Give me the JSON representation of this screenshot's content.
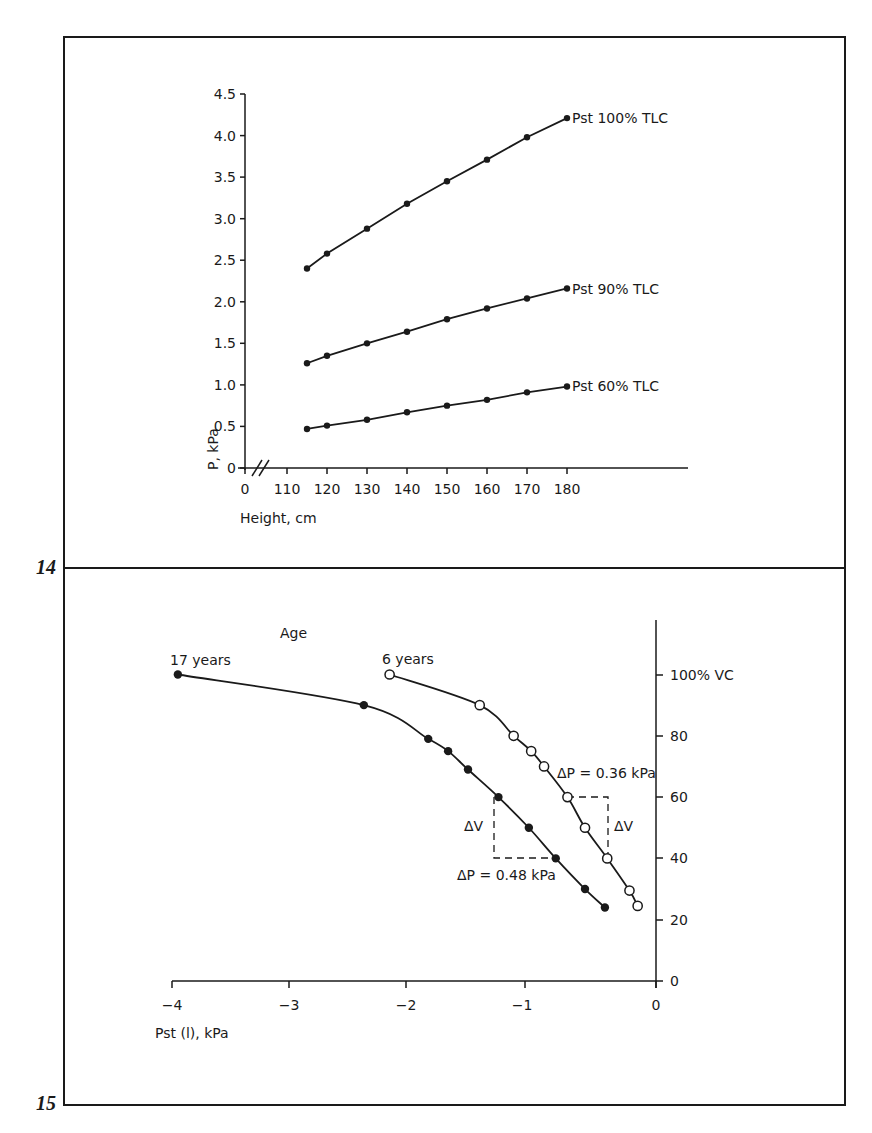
{
  "figures": [
    {
      "number": "14"
    },
    {
      "number": "15"
    }
  ],
  "chart_data": [
    {
      "type": "line",
      "figure": "14",
      "title": "",
      "xlabel": "Height, cm",
      "ylabel": "P, kPa",
      "x_ticks": [
        "0",
        "110",
        "120",
        "130",
        "140",
        "150",
        "160",
        "170",
        "180"
      ],
      "y_ticks": [
        "0",
        "0.5",
        "1.0",
        "1.5",
        "2.0",
        "2.5",
        "3.0",
        "3.5",
        "4.0",
        "4.5"
      ],
      "axis_break": "x axis broken between 0 and 110",
      "xlim": [
        110,
        180
      ],
      "ylim": [
        0,
        4.5
      ],
      "grid": false,
      "legend_position": "inline labels at right end of each line",
      "x": [
        115,
        120,
        130,
        140,
        150,
        160,
        170,
        180
      ],
      "series": [
        {
          "name": "Pst 100% TLC",
          "marker": "filled",
          "values": [
            2.4,
            2.58,
            2.88,
            3.18,
            3.45,
            3.71,
            3.98,
            4.21
          ]
        },
        {
          "name": "Pst 90% TLC",
          "marker": "filled",
          "values": [
            1.26,
            1.35,
            1.5,
            1.64,
            1.79,
            1.92,
            2.04,
            2.16
          ]
        },
        {
          "name": "Pst 60% TLC",
          "marker": "filled",
          "values": [
            0.47,
            0.51,
            0.58,
            0.67,
            0.75,
            0.82,
            0.91,
            0.98
          ]
        }
      ]
    },
    {
      "type": "line",
      "figure": "15",
      "title": "Age",
      "xlabel": "Pst (l), kPa",
      "ylabel": "% VC",
      "x_ticks": [
        "-4",
        "-3",
        "-2",
        "-1",
        "0"
      ],
      "y_ticks": [
        "0",
        "20",
        "40",
        "60",
        "80",
        "100% VC"
      ],
      "xlim": [
        -4,
        0
      ],
      "ylim": [
        0,
        115
      ],
      "y_axis_position": "right",
      "grid": false,
      "series": [
        {
          "name": "17 years",
          "marker": "filled",
          "x": [
            -3.95,
            -2.36,
            -1.81,
            -1.64,
            -1.47,
            -1.21,
            -0.95,
            -0.72,
            -0.47,
            -0.3
          ],
          "y": [
            100,
            90,
            79,
            75,
            69,
            60,
            50,
            40,
            30,
            24
          ]
        },
        {
          "name": "6 years",
          "marker": "open",
          "x": [
            -2.14,
            -1.37,
            -1.08,
            -0.93,
            -0.82,
            -0.62,
            -0.47,
            -0.28,
            -0.09,
            -0.02
          ],
          "y": [
            100,
            90,
            80,
            75,
            70,
            60,
            50,
            40,
            29.5,
            24.5
          ]
        }
      ],
      "annotations": [
        {
          "text": "ΔV",
          "series": "17 years"
        },
        {
          "text": "ΔP = 0.48 kPa",
          "series": "17 years"
        },
        {
          "text": "ΔV",
          "series": "6 years"
        },
        {
          "text": "ΔP = 0.36 kPa",
          "series": "6 years"
        }
      ]
    }
  ],
  "labels": {
    "fig14": {
      "ylabel": "P, kPa",
      "xlabel": "Height, cm",
      "series_100": "Pst  100% TLC",
      "series_90": "Pst  90% TLC",
      "series_60": "Pst  60% TLC",
      "yt0": "0",
      "yt1": "0.5",
      "yt2": "1.0",
      "yt3": "1.5",
      "yt4": "2.0",
      "yt5": "2.5",
      "yt6": "3.0",
      "yt7": "3.5",
      "yt8": "4.0",
      "yt9": "4.5",
      "xt0": "0",
      "xt1": "110",
      "xt2": "120",
      "xt3": "130",
      "xt4": "140",
      "xt5": "150",
      "xt6": "160",
      "xt7": "170",
      "xt8": "180"
    },
    "fig15": {
      "title": "Age",
      "series_17": "17 years",
      "series_6": "6 years",
      "xlabel": "Pst (l), kPa",
      "xt0": "−4",
      "xt1": "−3",
      "xt2": "−2",
      "xt3": "−1",
      "xt4": "0",
      "yt0": "0",
      "yt1": "20",
      "yt2": "40",
      "yt3": "60",
      "yt4": "80",
      "yt5": "100% VC",
      "dv_left": "ΔV",
      "dp_left": "ΔP = 0.48 kPa",
      "dv_right": "ΔV",
      "dp_right": "ΔP = 0.36 kPa"
    }
  }
}
